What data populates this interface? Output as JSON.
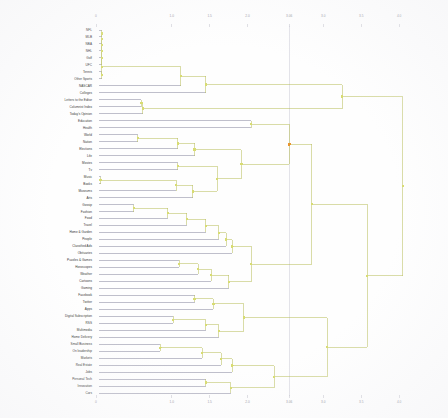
{
  "chart_data": {
    "type": "dendrogram",
    "title": "",
    "subtitle": "",
    "xlabel": "",
    "ylabel": "",
    "orientation": "horizontal",
    "grid": false,
    "legend": "none",
    "xlim": [
      0,
      4.5
    ],
    "xticks": [
      "0",
      "1.0",
      "1.5",
      "2.0",
      "3.06",
      "3.0",
      "3.5",
      "4.0"
    ],
    "xtick_positions": [
      0.0,
      1.0,
      1.5,
      2.0,
      2.55,
      3.0,
      3.5,
      4.0
    ],
    "reference_line": {
      "x": 2.55,
      "label": "3.06",
      "color": "#c8c8d4"
    },
    "link_color": "#b9bf5e",
    "link_color_alt": "#8a8aa0",
    "node_color": "#d8dc72",
    "highlight_node_color": "#e8952e",
    "highlight_node": {
      "x": 2.55,
      "index": 16
    },
    "leaf_labels": [
      "NFL",
      "MLB",
      "NBA",
      "NHL",
      "Golf",
      "UFC",
      "Tennis",
      "Other Sports",
      "NASCAR",
      "Colleges",
      "Letters to the Editor",
      "Columnist Index",
      "Today's Opinion",
      "Education",
      "Health",
      "World",
      "Nation",
      "Elections",
      "Life",
      "Movies",
      "Tv",
      "Music",
      "Books",
      "Museums",
      "Arts",
      "Gossip",
      "Fashion",
      "Food",
      "Travel",
      "Home & Garden",
      "People",
      "Classified Ads",
      "Obituaries",
      "Puzzles & Games",
      "Horoscopes",
      "Weather",
      "Cartoons",
      "Gaming",
      "Facebook",
      "Twitter",
      "Apps",
      "Digital Subscription",
      "RSS",
      "Multimedia",
      "Home Delivery",
      "Small Business",
      "On leadership",
      "Markets",
      "Real Estate",
      "Jobs",
      "Personal Tech",
      "Innovation",
      "Cars"
    ],
    "links": [
      {
        "x1": 0.07,
        "y1": 0,
        "x2": 0.07,
        "y2": 5,
        "h": 0.07,
        "note": "NFL..UFC tight cluster"
      },
      {
        "merge": "sports-core",
        "height": 0.07
      },
      {
        "merge": "sports-mid",
        "height": 1.12
      },
      {
        "merge": "sports-all",
        "height": 1.45
      },
      {
        "merge": "opinion",
        "height": 0.62
      },
      {
        "merge": "news-world-nation",
        "height": 0.55
      },
      {
        "merge": "news-elections",
        "height": 1.08
      },
      {
        "merge": "movies-tv",
        "height": 1.08
      },
      {
        "merge": "music-books",
        "height": 0.06
      },
      {
        "merge": "arts-museums",
        "height": 1.1
      },
      {
        "merge": "culture",
        "height": 1.38
      },
      {
        "merge": "lifestyle",
        "height": 1.52
      },
      {
        "merge": "features",
        "height": 1.7
      },
      {
        "merge": "services",
        "height": 1.95
      },
      {
        "merge": "social",
        "height": 2.1
      },
      {
        "merge": "business",
        "height": 2.3
      },
      {
        "merge": "tech",
        "height": 2.55
      },
      {
        "merge": "root",
        "height": 4.05
      }
    ]
  }
}
